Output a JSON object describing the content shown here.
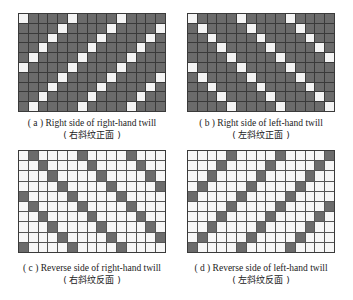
{
  "figure": {
    "rows": 10,
    "cols": 15,
    "colors": {
      "dark": "#6b6b6b",
      "light": "#f4f4f4",
      "grid_line": "#3a3a3a"
    },
    "panels": [
      {
        "id": "a",
        "caption_en": "( a ) Right side of right-hand twill",
        "caption_cn": "( 右斜纹正面 )",
        "base": "dark",
        "marked_rule": "(col + row) mod 5 == 0",
        "box": {
          "left": 18,
          "top": 13,
          "width": 148,
          "height": 99
        }
      },
      {
        "id": "b",
        "caption_en": "( b ) Right side of left-hand twill",
        "caption_cn": "( 左斜纹正面 )",
        "base": "dark",
        "marked_rule": "(col - row) mod 5 == 0",
        "box": {
          "left": 187,
          "top": 13,
          "width": 148,
          "height": 99
        }
      },
      {
        "id": "c",
        "caption_en": "( c ) Reverse side of right-hand twill",
        "caption_cn": "( 右斜纹反面 )",
        "base": "light",
        "marked_rule": "(col - row - 1) mod 5 == 0",
        "box": {
          "left": 18,
          "top": 150,
          "width": 148,
          "height": 103
        }
      },
      {
        "id": "d",
        "caption_en": "( d ) Reverse side of left-hand twill",
        "caption_cn": "( 左斜纹反面 )",
        "base": "light",
        "marked_rule": "(col + row) mod 5 == 4",
        "box": {
          "left": 187,
          "top": 150,
          "width": 148,
          "height": 103
        }
      }
    ]
  }
}
